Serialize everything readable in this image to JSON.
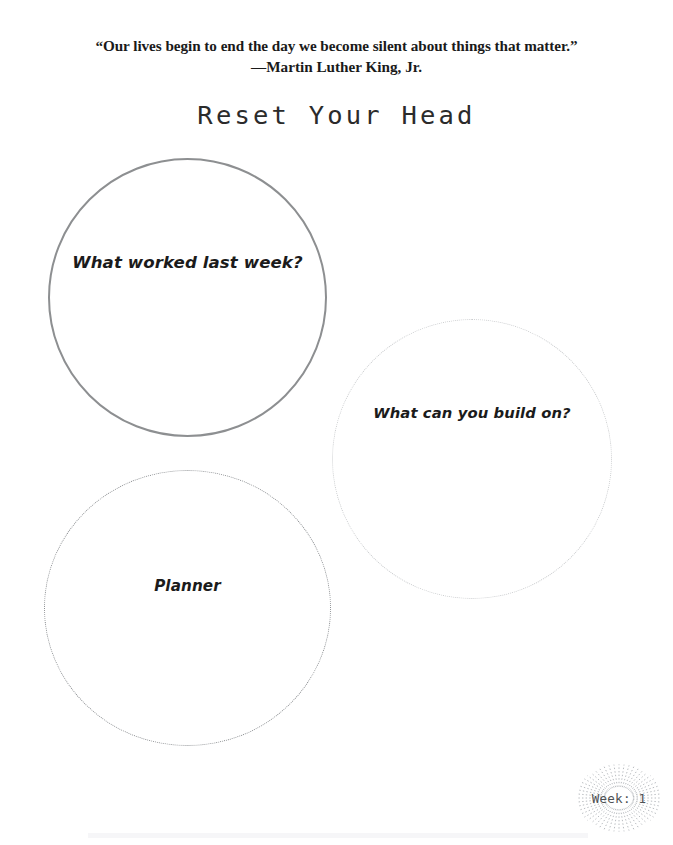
{
  "page": {
    "background_color": "#ffffff",
    "width": 673,
    "height": 845
  },
  "quote": {
    "text": "“Our lives begin to end the day we become silent about things that matter.”",
    "attribution": "—Martin Luther King, Jr."
  },
  "title": {
    "text": "Reset Your Head"
  },
  "bubbles": [
    {
      "label": "What worked last week?",
      "border_style": "solid",
      "border_color": "#8d8f91",
      "icon": "circle-outline-icon"
    },
    {
      "label": "What can you build on?",
      "border_style": "hairline",
      "border_color": "#c9cbcd",
      "icon": "circle-outline-icon"
    },
    {
      "label": "Planner",
      "border_style": "dotted",
      "border_color": "#8a8d90",
      "icon": "circle-dotted-icon"
    }
  ],
  "badge": {
    "label": "Week: 1",
    "icon": "sunburst-icon",
    "color": "#4e5154",
    "burst_color": "#b9bcc0"
  }
}
